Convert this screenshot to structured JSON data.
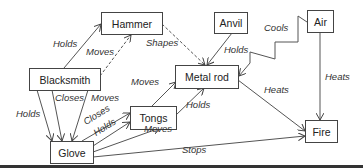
{
  "nodes": {
    "hammer": "Hammer",
    "anvil": "Anvil",
    "air": "Air",
    "blacksmith": "Blacksmith",
    "metal_rod": "Metal rod",
    "tongs": "Tongs",
    "glove": "Glove",
    "fire": "Fire"
  },
  "edges": [
    {
      "from": "Blacksmith",
      "to": "Hammer",
      "label": "Holds",
      "style": "solid"
    },
    {
      "from": "Blacksmith",
      "to": "Hammer",
      "label": "Moves",
      "style": "dashed"
    },
    {
      "from": "Hammer",
      "to": "Metal rod",
      "label": "Shapes",
      "style": "dashed"
    },
    {
      "from": "Anvil",
      "to": "Metal rod",
      "label": "Holds",
      "style": "solid"
    },
    {
      "from": "Air",
      "to": "Metal rod",
      "label": "Cools",
      "style": "solid"
    },
    {
      "from": "Air",
      "to": "Fire",
      "label": "Heats",
      "style": "solid"
    },
    {
      "from": "Metal rod",
      "to": "Fire",
      "label": "Heats",
      "style": "solid"
    },
    {
      "from": "Blacksmith",
      "to": "Glove",
      "label": "Holds",
      "style": "solid"
    },
    {
      "from": "Blacksmith",
      "to": "Glove",
      "label": "Closes",
      "style": "solid"
    },
    {
      "from": "Blacksmith",
      "to": "Glove",
      "label": "Moves",
      "style": "solid"
    },
    {
      "from": "Tongs",
      "to": "Metal rod",
      "label": "Moves",
      "style": "solid"
    },
    {
      "from": "Tongs",
      "to": "Metal rod",
      "label": "Holds",
      "style": "solid"
    },
    {
      "from": "Glove",
      "to": "Tongs",
      "label": "Closes",
      "style": "solid"
    },
    {
      "from": "Glove",
      "to": "Tongs",
      "label": "Holds",
      "style": "solid"
    },
    {
      "from": "Glove",
      "to": "Metal rod",
      "label": "Moves",
      "style": "solid"
    },
    {
      "from": "Glove",
      "to": "Fire",
      "label": "Stops",
      "style": "solid"
    }
  ],
  "labels": {
    "holds_bs_hammer": "Holds",
    "moves_bs_hammer": "Moves",
    "shapes": "Shapes",
    "holds_anvil": "Holds",
    "cools": "Cools",
    "heats_air": "Heats",
    "heats_rod": "Heats",
    "holds_bs_glove": "Holds",
    "closes_bs_glove": "Closes",
    "moves_bs_glove": "Moves",
    "moves_tongs_rod": "Moves",
    "holds_tongs_rod": "Holds",
    "closes_glove_tongs": "Closes",
    "holds_glove_tongs": "Holds",
    "moves_glove_rod": "Moves",
    "stops": "Stops"
  }
}
